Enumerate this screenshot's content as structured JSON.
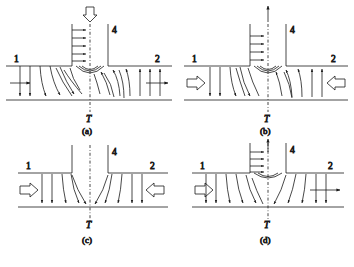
{
  "figure": {
    "background_color": "#ffffff",
    "line_color": "#1a1a1a",
    "panel_count": 4
  },
  "labels": {
    "port_1": "1",
    "port_2": "2",
    "port_4": "4",
    "branch_T": "T"
  },
  "captions": {
    "a": "(a)",
    "b": "(b)",
    "c": "(c)",
    "d": "(d)"
  },
  "panels": [
    {
      "id": "a",
      "caption": "(a)",
      "branch_top_arrow": "hollow-down-arrow",
      "branch_flow_direction": "inflow-down",
      "left_port_arrow": "thin-right-arrow",
      "left_port_direction": "outflow-left-to-right",
      "right_port_arrow": "thin-right-arrow",
      "right_port_direction": "outflow-right",
      "branch_velocity_arrows": "right-pointing",
      "branch_velocity_arrow_count": 5,
      "description": "Flow enters through branch 4 and splits to outlets 1 and 2"
    },
    {
      "id": "b",
      "caption": "(b)",
      "branch_top_arrow": "thin-up-arrow",
      "branch_flow_direction": "outflow-up",
      "left_port_arrow": "hollow-right-arrow",
      "left_port_direction": "inflow-from-left",
      "right_port_arrow": "hollow-left-arrow",
      "right_port_direction": "inflow-from-right",
      "branch_velocity_arrows": "right-pointing",
      "branch_velocity_arrow_count": 4,
      "description": "Flow enters from both 1 and 2 and exits through branch 4"
    },
    {
      "id": "c",
      "caption": "(c)",
      "branch_top_arrow": "none",
      "branch_flow_direction": "no-flow",
      "left_port_arrow": "hollow-right-arrow",
      "left_port_direction": "inflow-from-left",
      "right_port_arrow": "hollow-left-arrow",
      "right_port_direction": "inflow-from-right",
      "branch_velocity_arrows": "none",
      "branch_velocity_arrow_count": 0,
      "description": "Branch 4 closed; opposed inflows from 1 and 2 meet at the junction"
    },
    {
      "id": "d",
      "caption": "(d)",
      "branch_top_arrow": "thin-up-arrow",
      "branch_flow_direction": "outflow-up",
      "left_port_arrow": "hollow-right-arrow",
      "left_port_direction": "inflow-from-left",
      "right_port_arrow": "thin-right-arrow",
      "right_port_direction": "outflow-right",
      "branch_velocity_arrows": "right-pointing",
      "branch_velocity_arrow_count": 4,
      "description": "Flow enters at 1 and splits between branch 4 and outlet 2"
    }
  ]
}
